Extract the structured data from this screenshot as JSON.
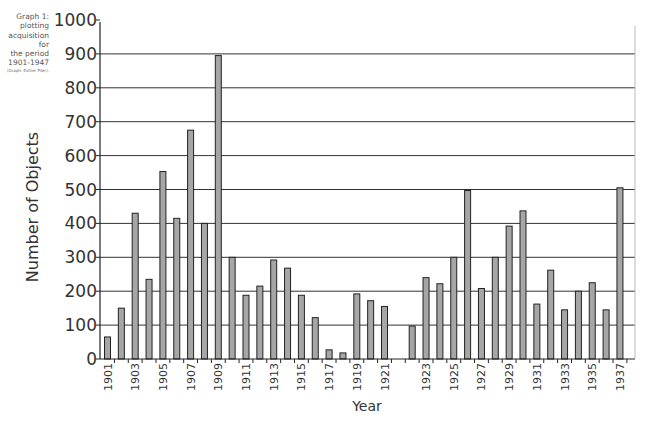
{
  "caption": {
    "lines": [
      "Graph 1:",
      "plotting",
      "acquisition for",
      "the period",
      "1901-1947"
    ],
    "credit": "(Graph: Esther Piler)."
  },
  "colors": {
    "bar_fill": "#a6a6a6",
    "bar_stroke": "#222222",
    "grid": "#333333",
    "right_border": "#bbbbbb"
  },
  "chart_data": {
    "type": "bar",
    "title": "",
    "xlabel": "Year",
    "ylabel": "Number of Objects",
    "ylim": [
      0,
      1000
    ],
    "yticks": [
      0,
      100,
      200,
      300,
      400,
      500,
      600,
      700,
      800,
      900,
      1000
    ],
    "grid": true,
    "legend": null,
    "categories": [
      "1901",
      "1902",
      "1903",
      "1904",
      "1905",
      "1906",
      "1907",
      "1908",
      "1909",
      "1910",
      "1911",
      "1912",
      "1913",
      "1914",
      "1915",
      "1916",
      "1917",
      "1918",
      "1919",
      "1920",
      "1921",
      "",
      "1922",
      "1923",
      "1924",
      "1925",
      "1926",
      "1927",
      "1928",
      "1929",
      "1930",
      "1931",
      "1932",
      "1933",
      "1934",
      "1935",
      "1936",
      "1937"
    ],
    "tick_labels_shown": [
      "1901",
      "1903",
      "1905",
      "1907",
      "1909",
      "1911",
      "1913",
      "1915",
      "1917",
      "1919",
      "1921",
      "1923",
      "1925",
      "1927",
      "1929",
      "1931",
      "1933",
      "1935",
      "1937"
    ],
    "values": [
      65,
      150,
      430,
      235,
      553,
      415,
      675,
      400,
      895,
      300,
      188,
      215,
      292,
      268,
      188,
      122,
      27,
      18,
      192,
      172,
      155,
      null,
      97,
      240,
      222,
      300,
      497,
      208,
      300,
      392,
      437,
      162,
      262,
      145,
      200,
      225,
      145,
      505
    ]
  }
}
